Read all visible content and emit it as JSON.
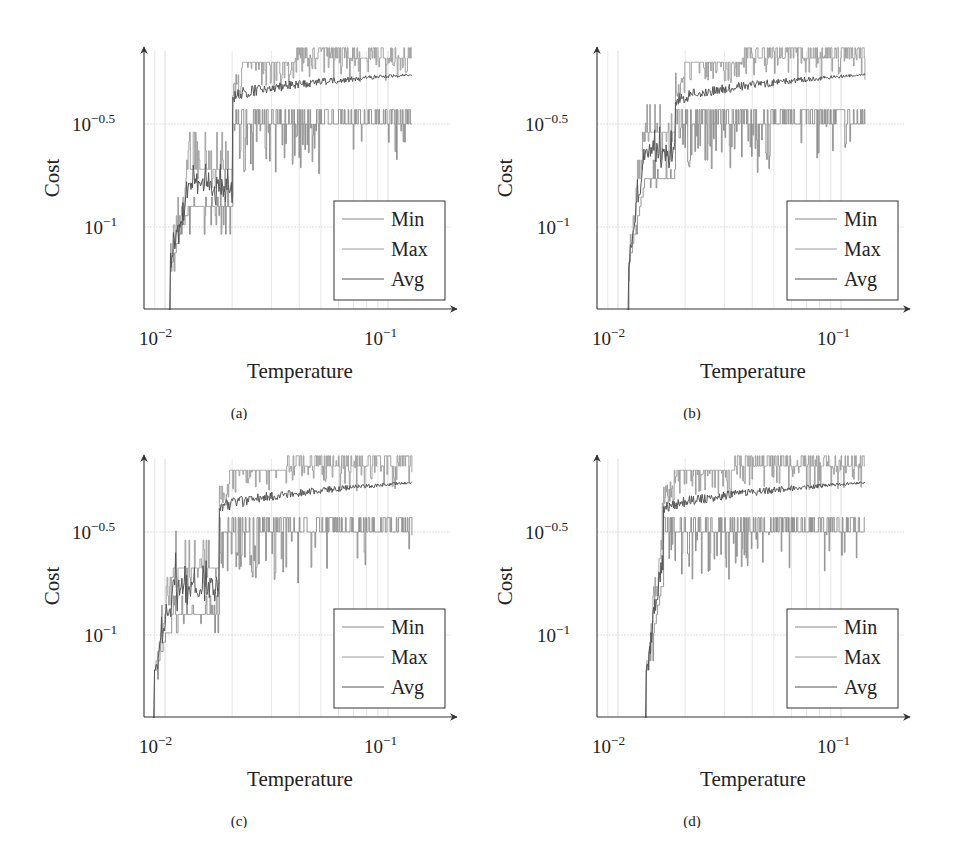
{
  "figure": {
    "panels": [
      {
        "caption": "(a)"
      },
      {
        "caption": "(b)"
      },
      {
        "caption": "(c)"
      },
      {
        "caption": "(d)"
      }
    ]
  },
  "colors": {
    "min": "#8a8a8a",
    "max": "#9a9a9a",
    "avg": "#555555",
    "axis": "#333333",
    "grid": "#d6d6d6"
  },
  "chart_data": [
    {
      "type": "line",
      "panel": "(a)",
      "xlabel": "Temperature",
      "ylabel": "Cost",
      "xscale": "log",
      "yscale": "log",
      "xticks": [
        "10^-2",
        "10^-1"
      ],
      "yticks": [
        "10^-1",
        "10^-0.5"
      ],
      "xlim_log10": [
        -2.1,
        -0.7
      ],
      "ylim_log10": [
        -1.4,
        -0.13
      ],
      "grid": true,
      "legend": {
        "entries": [
          "Min",
          "Max",
          "Avg"
        ],
        "position": "lower right"
      },
      "x_start": 0.0105,
      "x_end": 0.128,
      "transition_x": 0.02,
      "series": [
        {
          "name": "Min",
          "early_log10": -0.92,
          "late_log10": -0.5,
          "top_log10": -0.43,
          "end_log10": -0.43
        },
        {
          "name": "Max",
          "early_log10": -0.72,
          "late_log10": -0.2,
          "top_log10": -0.13,
          "end_log10": -0.13
        },
        {
          "name": "Avg",
          "early_log10": -0.8,
          "late_log10": -0.38,
          "top_log10": -0.26,
          "end_log10": -0.26
        }
      ]
    },
    {
      "type": "line",
      "panel": "(b)",
      "xlabel": "Temperature",
      "ylabel": "Cost",
      "xscale": "log",
      "yscale": "log",
      "xticks": [
        "10^-2",
        "10^-1"
      ],
      "yticks": [
        "10^-1",
        "10^-0.5"
      ],
      "xlim_log10": [
        -2.1,
        -0.7
      ],
      "ylim_log10": [
        -1.4,
        -0.13
      ],
      "grid": true,
      "legend": {
        "entries": [
          "Min",
          "Max",
          "Avg"
        ],
        "position": "lower right"
      },
      "x_start": 0.0111,
      "x_end": 0.128,
      "transition_x": 0.018,
      "series": [
        {
          "name": "Min",
          "early_log10": -0.75,
          "late_log10": -0.5,
          "top_log10": -0.43,
          "end_log10": -0.43
        },
        {
          "name": "Max",
          "early_log10": -0.55,
          "late_log10": -0.2,
          "top_log10": -0.13,
          "end_log10": -0.13
        },
        {
          "name": "Avg",
          "early_log10": -0.62,
          "late_log10": -0.4,
          "top_log10": -0.26,
          "end_log10": -0.26
        }
      ]
    },
    {
      "type": "line",
      "panel": "(c)",
      "xlabel": "Temperature",
      "ylabel": "Cost",
      "xscale": "log",
      "yscale": "log",
      "xticks": [
        "10^-2",
        "10^-1"
      ],
      "yticks": [
        "10^-1",
        "10^-0.5"
      ],
      "xlim_log10": [
        -2.1,
        -0.7
      ],
      "ylim_log10": [
        -1.4,
        -0.13
      ],
      "grid": true,
      "legend": {
        "entries": [
          "Min",
          "Max",
          "Avg"
        ],
        "position": "lower right"
      },
      "x_start": 0.0089,
      "x_end": 0.128,
      "transition_x": 0.0175,
      "series": [
        {
          "name": "Min",
          "early_log10": -0.88,
          "late_log10": -0.5,
          "top_log10": -0.43,
          "end_log10": -0.43
        },
        {
          "name": "Max",
          "early_log10": -0.68,
          "late_log10": -0.2,
          "top_log10": -0.13,
          "end_log10": -0.13
        },
        {
          "name": "Avg",
          "early_log10": -0.76,
          "late_log10": -0.4,
          "top_log10": -0.26,
          "end_log10": -0.26
        }
      ]
    },
    {
      "type": "line",
      "panel": "(d)",
      "xlabel": "Temperature",
      "ylabel": "Cost",
      "xscale": "log",
      "yscale": "log",
      "xticks": [
        "10^-2",
        "10^-1"
      ],
      "yticks": [
        "10^-1",
        "10^-0.5"
      ],
      "xlim_log10": [
        -2.1,
        -0.7
      ],
      "ylim_log10": [
        -1.4,
        -0.13
      ],
      "grid": true,
      "legend": {
        "entries": [
          "Min",
          "Max",
          "Avg"
        ],
        "position": "lower right"
      },
      "x_start": 0.0133,
      "x_end": 0.128,
      "transition_x": 0.016,
      "series": [
        {
          "name": "Min",
          "early_log10": -0.75,
          "late_log10": -0.5,
          "top_log10": -0.43,
          "end_log10": -0.43
        },
        {
          "name": "Max",
          "early_log10": -0.55,
          "late_log10": -0.2,
          "top_log10": -0.13,
          "end_log10": -0.13
        },
        {
          "name": "Avg",
          "early_log10": -0.65,
          "late_log10": -0.4,
          "top_log10": -0.26,
          "end_log10": -0.26
        }
      ]
    }
  ]
}
